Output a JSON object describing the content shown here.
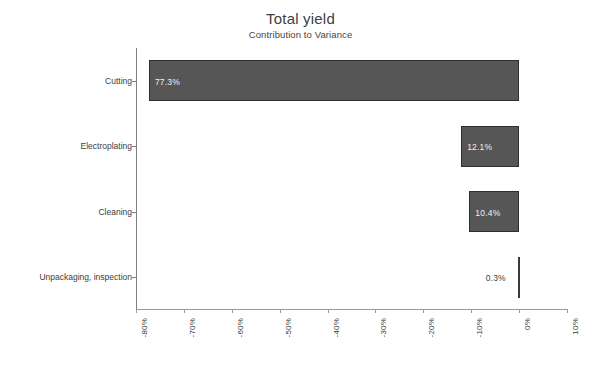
{
  "chart_data": {
    "type": "bar",
    "orientation": "horizontal",
    "title": "Total yield",
    "subtitle": "Contribution to Variance",
    "xlabel": "",
    "ylabel": "",
    "grid": false,
    "legend": null,
    "xlim": [
      -80,
      10
    ],
    "xtick_step": 10,
    "xticks": [
      "-80%",
      "-70%",
      "-60%",
      "-50%",
      "-40%",
      "-30%",
      "-20%",
      "-10%",
      "0%",
      "10%"
    ],
    "xtick_values": [
      -80,
      -70,
      -60,
      -50,
      -40,
      -30,
      -20,
      -10,
      0,
      10
    ],
    "categories": [
      "Cutting",
      "Electroplating",
      "Cleaning",
      "Unpackaging, inspection"
    ],
    "values": [
      -77.3,
      -12.1,
      -10.4,
      -0.3
    ],
    "data_labels": [
      "77.3%",
      "12.1%",
      "10.4%",
      "0.3%"
    ],
    "label_placement": [
      "inside",
      "inside",
      "inside",
      "outside"
    ],
    "bar_color": "#565656",
    "bar_edge_color": "#2f2f2f",
    "inside_label_color": "#f2f2f2",
    "outside_label_color": "#3b3b3b",
    "axis_color": "#8a8a8a",
    "background_color": "#ffffff",
    "bars": [
      {
        "category": "Cutting",
        "value": -77.3,
        "label": "77.3%"
      },
      {
        "category": "Electroplating",
        "value": -12.1,
        "label": "12.1%"
      },
      {
        "category": "Cleaning",
        "value": -10.4,
        "label": "10.4%"
      },
      {
        "category": "Unpackaging, inspection",
        "value": -0.3,
        "label": "0.3%"
      }
    ]
  }
}
